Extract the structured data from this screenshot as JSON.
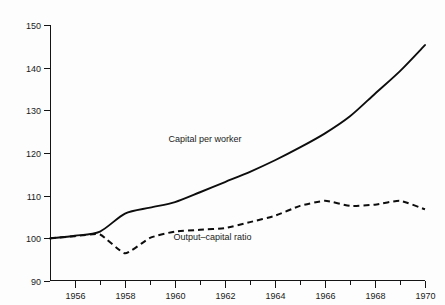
{
  "chart_data": {
    "type": "line",
    "title": "",
    "subtitle": "",
    "xlabel": "",
    "ylabel": "",
    "xlim": [
      1955,
      1970
    ],
    "ylim": [
      90,
      150
    ],
    "grid": false,
    "legend_position": "inline-annotation",
    "x": [
      1955,
      1956,
      1957,
      1958,
      1959,
      1960,
      1961,
      1962,
      1963,
      1964,
      1965,
      1966,
      1967,
      1968,
      1969,
      1970
    ],
    "y_ticks": [
      90,
      100,
      110,
      120,
      130,
      140,
      150
    ],
    "y_tick_labels": [
      "90",
      "100",
      "110",
      "120",
      "130",
      "140",
      "150"
    ],
    "x_ticks_major": [
      1956,
      1958,
      1960,
      1962,
      1964,
      1966,
      1968,
      1970
    ],
    "x_tick_labels": [
      "1956",
      "1958",
      "1960",
      "1962",
      "1964",
      "1966",
      "1968",
      "1970"
    ],
    "x_ticks_minor": [
      1955,
      1957,
      1959,
      1961,
      1963,
      1965,
      1967,
      1969
    ],
    "series": [
      {
        "name": "Capital per worker",
        "style": "solid",
        "color": "#0d0d0d",
        "label_x": 1961.2,
        "label_y": 122.5,
        "values": [
          100.0,
          100.6,
          101.6,
          105.8,
          107.2,
          108.5,
          110.8,
          113.2,
          115.6,
          118.3,
          121.3,
          124.6,
          128.6,
          133.9,
          139.2,
          145.3
        ]
      },
      {
        "name": "Output–capital ratio",
        "style": "dashed",
        "color": "#0d0d0d",
        "label_x": 1961.5,
        "label_y": 99.6,
        "values": [
          100.0,
          100.5,
          100.9,
          96.5,
          100.1,
          101.6,
          102.0,
          102.4,
          103.8,
          105.3,
          107.6,
          108.8,
          107.6,
          107.9,
          108.8,
          106.8
        ]
      }
    ]
  },
  "labels": {
    "series_capital": "Capital per worker",
    "series_output": "Output–capital ratio"
  },
  "colors": {
    "ink": "#0d0d0d",
    "background": "#fdfdfd"
  }
}
